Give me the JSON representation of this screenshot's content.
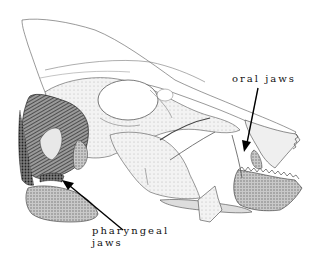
{
  "figure": {
    "labels": {
      "oral_jaws": "oral jaws",
      "pharyngeal_line1": "pharyngeal",
      "pharyngeal_line2": "jaws"
    },
    "annotations": [
      {
        "id": "oral-jaws-arrow",
        "target": "oral jaws",
        "from": [
          258,
          88
        ],
        "to": [
          246,
          150
        ]
      },
      {
        "id": "pharyngeal-jaws-arrow",
        "target": "pharyngeal jaws",
        "from": [
          123,
          230
        ],
        "to": [
          65,
          182
        ]
      }
    ],
    "colors": {
      "ink": "#111111",
      "bone_fill": "#f4f4f4",
      "shade_light": "#bdbdbd",
      "shade_dark": "#555555",
      "background": "#ffffff"
    }
  }
}
